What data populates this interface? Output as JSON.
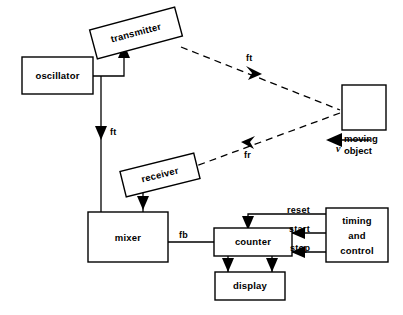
{
  "diagram": {
    "type": "block-diagram",
    "blocks": {
      "oscillator": {
        "label": "oscillator",
        "x": 22,
        "y": 57,
        "w": 71,
        "h": 37,
        "rotation": 0
      },
      "transmitter": {
        "label": "transmitter",
        "x": 92,
        "y": 18,
        "w": 88,
        "h": 30,
        "rotation": -15
      },
      "receiver": {
        "label": "receiver",
        "x": 122,
        "y": 162,
        "w": 76,
        "h": 26,
        "rotation": -14
      },
      "mixer": {
        "label": "mixer",
        "x": 88,
        "y": 212,
        "w": 80,
        "h": 50,
        "rotation": 0
      },
      "counter": {
        "label": "counter",
        "x": 214,
        "y": 228,
        "w": 78,
        "h": 28,
        "rotation": 0
      },
      "display": {
        "label": "display",
        "x": 215,
        "y": 272,
        "w": 70,
        "h": 28,
        "rotation": 0
      },
      "timing_and_control": {
        "label_line1": "timing",
        "label_line2": "and",
        "label_line3": "control",
        "x": 326,
        "y": 208,
        "w": 62,
        "h": 54,
        "rotation": 0
      },
      "moving_object": {
        "label_line1": "moving",
        "label_line2": "object",
        "x": 342,
        "y": 85,
        "w": 44,
        "h": 45,
        "rotation": 0
      }
    },
    "signal_labels": {
      "ft_transmitted": "ft",
      "ft_reference": "ft",
      "fr_received": "fr",
      "fb_beat": "fb",
      "reset": "reset",
      "start": "start",
      "stop": "stop",
      "velocity": "v"
    },
    "colors": {
      "stroke": "#000000",
      "fill": "#ffffff",
      "background": "#ffffff"
    }
  }
}
